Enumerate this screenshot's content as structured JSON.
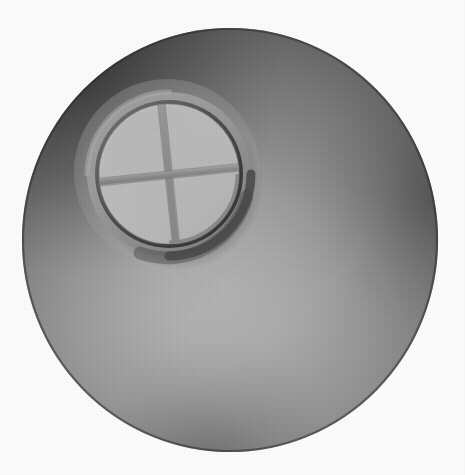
{
  "scene": {
    "title": "Grayscale 3D render of a sphere with a recessed porthole window",
    "background_color": "#ffffff",
    "canvas": {
      "width": 465,
      "height": 475
    }
  },
  "sphere": {
    "name": "sphere-body",
    "center_x": 230,
    "center_y": 240,
    "radius_x": 208,
    "radius_y": 212,
    "bounds": {
      "left": 22,
      "top": 28,
      "right": 438,
      "bottom": 452
    },
    "highlight_x": 232,
    "highlight_y": 292,
    "colors": {
      "highlight": "#d6d6d6",
      "midtone": "#a8a8a8",
      "shadow": "#6e6e6e",
      "rim_dark": "#3a3a3a",
      "edge": "#2a2a2a"
    }
  },
  "window": {
    "name": "porthole-window",
    "center_x": 169,
    "center_y": 174,
    "halo_radius": 92,
    "ring_outer_radius": 82,
    "ring_inner_radius": 70,
    "glass_radius": 70,
    "colors": {
      "halo": "#b4b4b4",
      "ring_face": "#9a9a9a",
      "ring_highlight": "#b0b0b0",
      "rim_shadow": "#4d4d4d",
      "inner_bevel": "#8a8a8a",
      "glass_light": "#cfcfcf",
      "glass_dark": "#bdbdbd",
      "muntin": "#9c9c9c",
      "muntin_shadow": "#858585",
      "drop_shadow": "#555555"
    },
    "muntin": {
      "name": "window-cross-divider",
      "thickness": 6,
      "rotation_deg": -6,
      "pane_count": 4
    }
  },
  "lighting": {
    "direction": "upper-left",
    "key_light_angle_deg": 315,
    "ambient": "soft"
  }
}
